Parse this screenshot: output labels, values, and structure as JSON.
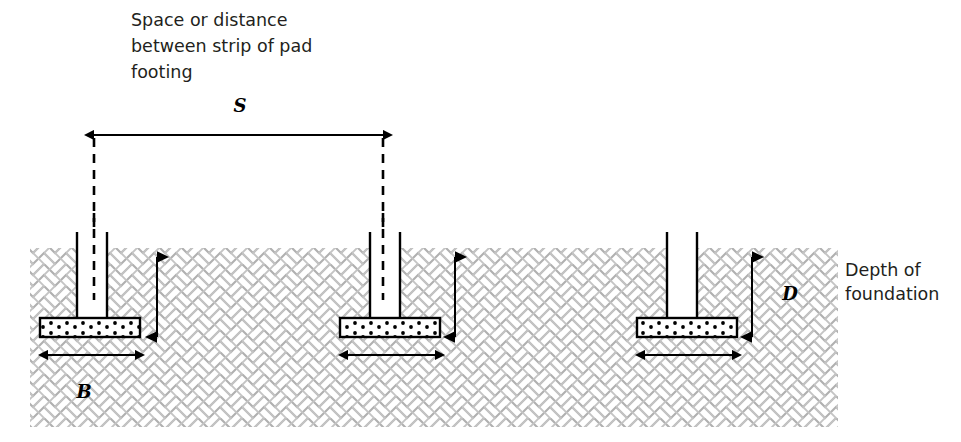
{
  "figure": {
    "title_caption": {
      "lines": [
        "Space or distance",
        "between strip of pad",
        "footing"
      ],
      "line1": "Space or distance",
      "line2": "between strip of pad",
      "line3": "footing"
    },
    "right_caption": {
      "lines": [
        "Depth of",
        "foundation"
      ],
      "line1": "Depth of",
      "line2": "foundation"
    },
    "dimension_labels": {
      "spacing": "S",
      "width": "B",
      "depth": "D"
    },
    "colors": {
      "soil_hatch": "#b3b3b3",
      "line": "#000000",
      "text": "#231f20",
      "footing_fill": "#ffffff",
      "background": "#ffffff"
    },
    "geometry": {
      "soil": {
        "x": 30,
        "y": 248,
        "width": 808,
        "height": 179
      },
      "spacing_dimension": {
        "x1": 94,
        "x2": 383,
        "y": 135
      },
      "footings": [
        {
          "name": "left-footing",
          "pad_x": 40,
          "pad_y": 318,
          "pad_w": 100,
          "pad_h": 19,
          "col_x": 77,
          "col_w": 30,
          "col_top": 232,
          "has_centerline": true,
          "centerline_x": 94,
          "depth_arrow_x": 157,
          "b_arrow_x1": 48,
          "b_arrow_x2": 135
        },
        {
          "name": "middle-footing",
          "pad_x": 340,
          "pad_y": 318,
          "pad_w": 100,
          "pad_h": 19,
          "col_x": 370,
          "col_w": 30,
          "col_top": 232,
          "has_centerline": true,
          "centerline_x": 383,
          "depth_arrow_x": 455,
          "b_arrow_x1": 348,
          "b_arrow_x2": 435
        },
        {
          "name": "right-footing",
          "pad_x": 637,
          "pad_y": 318,
          "pad_w": 100,
          "pad_h": 19,
          "col_x": 667,
          "col_w": 30,
          "col_top": 232,
          "has_centerline": false,
          "centerline_x": 0,
          "depth_arrow_x": 752,
          "b_arrow_x1": 645,
          "b_arrow_x2": 732
        }
      ],
      "depth_arrow": {
        "y_top": 257,
        "y_bottom": 337
      },
      "b_arrow_y": 355
    }
  }
}
